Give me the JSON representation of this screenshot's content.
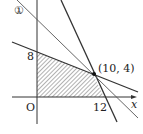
{
  "labels": {
    "circled_one": "①",
    "y_intercept": "8",
    "origin": "O",
    "x_intercept": "12",
    "x_axis": "x",
    "intersection": "(10,  4)"
  },
  "diagram": {
    "type": "linear-programming-feasible-region",
    "lines": [
      {
        "name": "line-1",
        "equation": "x + y = 14",
        "label": "①"
      },
      {
        "name": "line-a",
        "equation": "2x + 5y = 40",
        "through": [
          [
            0,
            8
          ],
          [
            10,
            4
          ]
        ]
      },
      {
        "name": "line-b",
        "equation": "2x + y = 24",
        "through": [
          [
            10,
            4
          ],
          [
            12,
            0
          ]
        ]
      }
    ],
    "feasible_region_vertices": [
      [
        0,
        0
      ],
      [
        0,
        8
      ],
      [
        10,
        4
      ],
      [
        12,
        0
      ]
    ],
    "highlight_point": [
      10,
      4
    ],
    "colors": {
      "line": "#333333",
      "hatch": "#555555"
    }
  }
}
